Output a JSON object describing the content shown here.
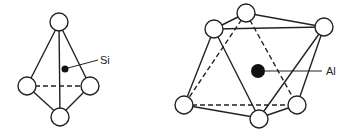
{
  "diagram": {
    "tetrahedron": {
      "center_label": "Si",
      "center_atom": "Si",
      "coordination": 4
    },
    "octahedron": {
      "center_label": "Al",
      "center_atom": "Al",
      "coordination": 6
    },
    "colors": {
      "line": "#222222",
      "atom_fill": "#ffffff",
      "center_fill": "#111111",
      "background": "#ffffff"
    }
  }
}
